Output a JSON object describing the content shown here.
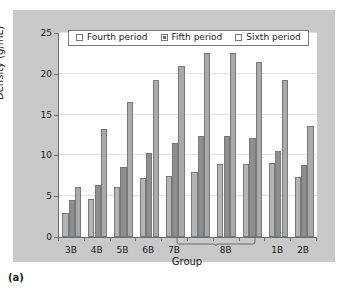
{
  "figure": {
    "caption": "(a)"
  },
  "chart_data": {
    "type": "bar",
    "title": "",
    "xlabel": "Group",
    "ylabel": "Density (g/mL)",
    "ylim": [
      0,
      25
    ],
    "yticks": [
      0,
      5,
      10,
      15,
      20,
      25
    ],
    "grid": true,
    "legend_position": "top-center",
    "categories": [
      "3B",
      "4B",
      "5B",
      "6B",
      "7B",
      "8B",
      "8B",
      "8B",
      "1B",
      "2B"
    ],
    "tick_labels": [
      "3B",
      "4B",
      "5B",
      "6B",
      "7B",
      "8B",
      "1B",
      "2B"
    ],
    "grouped_bracket": {
      "label": "8B",
      "spans_categories": 3
    },
    "series": [
      {
        "name": "Fourth period",
        "color": "#b3b4b5",
        "values": [
          3.0,
          4.6,
          6.1,
          7.2,
          7.5,
          8.0,
          9.0,
          9.0,
          9.1,
          7.3
        ]
      },
      {
        "name": "Fifth period",
        "color": "#8c8e90",
        "values": [
          4.5,
          6.4,
          8.6,
          10.3,
          11.5,
          12.4,
          12.4,
          12.1,
          10.5,
          8.8
        ]
      },
      {
        "name": "Sixth period",
        "color": "#a8aaac",
        "values": [
          6.1,
          13.2,
          16.5,
          19.3,
          20.9,
          22.5,
          22.5,
          21.4,
          19.3,
          13.6
        ]
      }
    ]
  }
}
